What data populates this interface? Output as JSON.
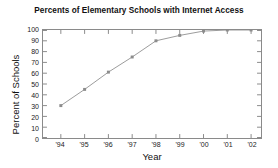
{
  "chart_data": {
    "type": "line",
    "title": "Percents of Elementary Schools with Internet Access",
    "xlabel": "Year",
    "ylabel": "Percent of Schools",
    "categories": [
      "'94",
      "'95",
      "'96",
      "'97",
      "'98",
      "'99",
      "'00",
      "'01",
      "'02"
    ],
    "values": [
      30,
      45,
      61,
      75,
      90,
      95,
      99,
      100,
      100
    ],
    "series": [
      {
        "name": "Percent of elementary schools with Internet access",
        "values": [
          30,
          45,
          61,
          75,
          90,
          95,
          99,
          100,
          100
        ]
      }
    ],
    "ylim": [
      0,
      100
    ],
    "yticks": [
      0,
      10,
      20,
      30,
      40,
      50,
      60,
      70,
      80,
      90,
      100
    ],
    "ytick_labels": [
      "0",
      "10",
      "20",
      "30",
      "40",
      "50",
      "60",
      "70",
      "80",
      "90",
      "100"
    ],
    "xtick_labels": [
      "'94",
      "'95",
      "'96",
      "'97",
      "'98",
      "'99",
      "'00",
      "'01",
      "'02"
    ],
    "grid": false,
    "legend": "none",
    "marker": "square",
    "line_color": "#9a9a9a",
    "marker_color": "#8c8c8c",
    "axis_color": "#8a8a8a",
    "background_color": "#ffffff"
  }
}
